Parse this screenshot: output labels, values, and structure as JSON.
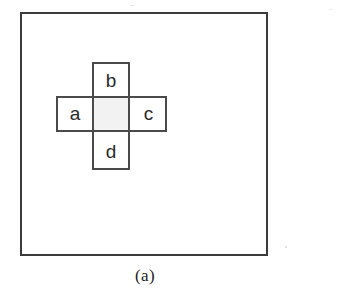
{
  "figure": {
    "caption": "(a)",
    "kind": "diagram",
    "colors": {
      "background": "#ffffff",
      "frame_stroke": "#3b3b3b",
      "cell_stroke": "#4a4a4a",
      "cell_fill": "#ffffff",
      "center_cell_fill": "#f2f2f2",
      "label_color": "#2a2a2a",
      "caption_color": "#222222"
    },
    "frame": {
      "name": "outer-boundary-square",
      "x": 20,
      "y": 12,
      "width": 248,
      "height": 244,
      "stroke_width": 2
    },
    "cells": [
      {
        "id": "center",
        "label": "",
        "x": 92,
        "y": 96,
        "width": 38,
        "height": 36,
        "shaded": true
      },
      {
        "id": "a",
        "label": "a",
        "x": 56,
        "y": 96,
        "width": 38,
        "height": 36,
        "shaded": false
      },
      {
        "id": "b",
        "label": "b",
        "x": 92,
        "y": 62,
        "width": 38,
        "height": 36,
        "shaded": false
      },
      {
        "id": "c",
        "label": "c",
        "x": 128,
        "y": 96,
        "width": 39,
        "height": 36,
        "shaded": false
      },
      {
        "id": "d",
        "label": "d",
        "x": 92,
        "y": 130,
        "width": 38,
        "height": 40,
        "shaded": false
      }
    ],
    "labels": {
      "a": "a",
      "b": "b",
      "c": "c",
      "d": "d"
    }
  }
}
